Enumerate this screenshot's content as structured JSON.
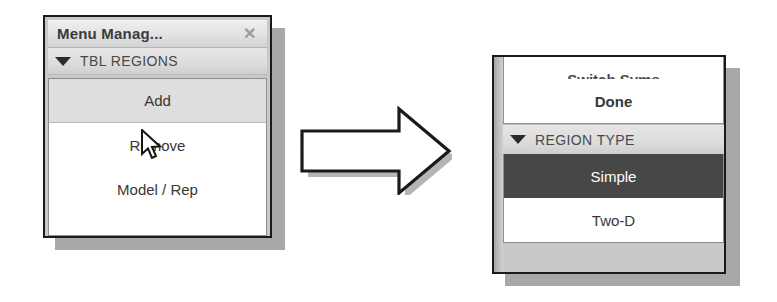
{
  "left_panel": {
    "title": "Menu Manag...",
    "close_icon": "close-x-icon",
    "group": {
      "expander_icon": "triangle-down-icon",
      "label": "TBL REGIONS"
    },
    "items": [
      {
        "label": "Add",
        "state": "hovered"
      },
      {
        "label": "Remove",
        "state": "normal"
      },
      {
        "label": "Model / Rep",
        "state": "normal"
      }
    ],
    "cursor_icon": "mouse-pointer-icon"
  },
  "arrow": {
    "icon": "right-block-arrow-icon",
    "direction": "right"
  },
  "right_panel": {
    "clipped_item": {
      "label": "Switch Syms"
    },
    "items_top": [
      {
        "label": "Done",
        "state": "bold"
      }
    ],
    "group": {
      "expander_icon": "triangle-down-icon",
      "label": "REGION TYPE"
    },
    "items_bottom": [
      {
        "label": "Simple",
        "state": "selected"
      },
      {
        "label": "Two-D",
        "state": "normal"
      }
    ]
  },
  "colors": {
    "panel_face": "#c9c9c9",
    "panel_border": "#1a1a1a",
    "shadow": "#a8a8a8",
    "list_bg": "#ffffff",
    "hover_row": "#dedede",
    "selected_row": "#474747",
    "selected_text": "#ffffff",
    "text": "#383838",
    "header_text": "#494949",
    "title_text": "#3b3b3b",
    "close_x": "#9a9a9a"
  }
}
